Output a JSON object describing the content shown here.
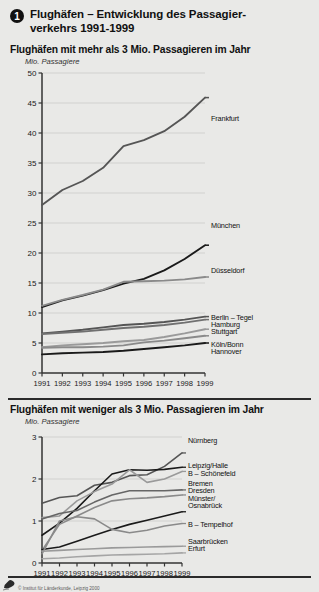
{
  "header": {
    "number": "1",
    "title_line1": "Flughäfen – Entwicklung des Passagier-",
    "title_line2": "verkehrs 1991-1999"
  },
  "panels": {
    "top": {
      "title": "Flughäfen mit mehr als 3 Mio. Passagieren im Jahr",
      "unit": "Mio. Passagiere"
    },
    "bottom": {
      "title": "Flughäfen mit weniger als 3 Mio. Passagieren im Jahr",
      "unit": "Mio. Passagiere"
    }
  },
  "footer": {
    "credit": "© Institut für Länderkunde, Leipzig 2000",
    "logo": "ifl-logo-icon"
  },
  "colors": {
    "background": "#e9e9e7",
    "dark_line": "#1a1a1a",
    "mid_line": "#666666",
    "light_line": "#9a9a9a",
    "grid": "#c9c9c5",
    "axis": "#333333"
  },
  "chart_data": [
    {
      "type": "line",
      "id": "top-chart",
      "title": "Flughäfen mit mehr als 3 Mio. Passagieren im Jahr",
      "xlabel": "",
      "ylabel": "Mio. Passagiere",
      "x": [
        "1991",
        "1992",
        "1993",
        "1994",
        "1995",
        "1996",
        "1997",
        "1998",
        "1999"
      ],
      "ylim": [
        0,
        50
      ],
      "yticks": [
        0,
        5,
        10,
        15,
        20,
        25,
        30,
        35,
        40,
        45,
        50
      ],
      "grid": true,
      "legend_position": "right-inline",
      "series": [
        {
          "name": "Frankfurt",
          "color": "#555555",
          "values": [
            28.0,
            30.5,
            32.0,
            34.2,
            37.8,
            38.8,
            40.3,
            42.7,
            45.9
          ]
        },
        {
          "name": "München",
          "color": "#1a1a1a",
          "values": [
            11.0,
            12.1,
            12.9,
            13.8,
            14.9,
            15.7,
            17.1,
            19.0,
            21.3
          ]
        },
        {
          "name": "Düsseldorf",
          "color": "#8a8a8a",
          "values": [
            11.2,
            12.2,
            13.0,
            13.9,
            15.2,
            15.3,
            15.4,
            15.6,
            16.0
          ]
        },
        {
          "name": "Berlin – Tegel",
          "color": "#555555",
          "values": [
            6.6,
            6.9,
            7.2,
            7.6,
            8.0,
            8.2,
            8.5,
            8.9,
            9.4
          ]
        },
        {
          "name": "Hamburg",
          "color": "#707070",
          "values": [
            6.5,
            6.7,
            6.9,
            7.2,
            7.5,
            7.7,
            8.0,
            8.4,
            8.9
          ]
        },
        {
          "name": "Stuttgart",
          "color": "#9a9a9a",
          "values": [
            4.3,
            4.6,
            4.8,
            5.0,
            5.3,
            5.5,
            6.0,
            6.6,
            7.3
          ]
        },
        {
          "name": "Köln/Bonn",
          "color": "#8a8a8a",
          "values": [
            4.2,
            4.3,
            4.3,
            4.4,
            4.6,
            5.1,
            5.4,
            5.8,
            6.2
          ]
        },
        {
          "name": "Hannover",
          "color": "#1a1a1a",
          "values": [
            3.1,
            3.3,
            3.4,
            3.5,
            3.7,
            4.0,
            4.3,
            4.6,
            5.0
          ]
        }
      ]
    },
    {
      "type": "line",
      "id": "bottom-chart",
      "title": "Flughäfen mit weniger als 3 Mio. Passagieren im Jahr",
      "xlabel": "",
      "ylabel": "Mio. Passagiere",
      "x": [
        "1991",
        "1992",
        "1993",
        "1994",
        "1995",
        "1996",
        "1997",
        "1998",
        "1999"
      ],
      "ylim": [
        0,
        3
      ],
      "yticks": [
        0,
        1,
        2,
        3
      ],
      "grid": true,
      "legend_position": "right-inline",
      "series": [
        {
          "name": "Nürnberg",
          "color": "#555555",
          "values": [
            1.42,
            1.56,
            1.6,
            1.85,
            1.92,
            2.08,
            2.1,
            2.3,
            2.62
          ]
        },
        {
          "name": "Leipzig/Halle",
          "color": "#1a1a1a",
          "values": [
            0.66,
            0.95,
            1.3,
            1.72,
            2.12,
            2.22,
            2.21,
            2.23,
            2.28
          ]
        },
        {
          "name": "B – Schönefeld",
          "color": "#9a9a9a",
          "values": [
            1.08,
            1.12,
            1.48,
            1.7,
            1.88,
            2.22,
            1.92,
            2.0,
            2.18
          ]
        },
        {
          "name": "Bremen",
          "color": "#666666",
          "values": [
            1.05,
            1.18,
            1.25,
            1.45,
            1.62,
            1.72,
            1.72,
            1.72,
            1.74
          ]
        },
        {
          "name": "Dresden",
          "color": "#8a8a8a",
          "values": [
            0.3,
            0.92,
            1.12,
            1.32,
            1.48,
            1.53,
            1.55,
            1.58,
            1.62
          ]
        },
        {
          "name": "Münster/Osnabrück",
          "color": "#1a1a1a",
          "values": [
            0.32,
            0.38,
            0.52,
            0.66,
            0.8,
            0.92,
            1.02,
            1.12,
            1.22
          ]
        },
        {
          "name": "B – Tempelhof",
          "color": "#8a8a8a",
          "values": [
            0.22,
            1.0,
            1.1,
            1.05,
            0.8,
            0.72,
            0.78,
            0.88,
            0.94
          ]
        },
        {
          "name": "Saarbrücken",
          "color": "#9a9a9a",
          "values": [
            0.28,
            0.3,
            0.32,
            0.34,
            0.36,
            0.37,
            0.38,
            0.39,
            0.4
          ]
        },
        {
          "name": "Erfurt",
          "color": "#a5a5a5",
          "values": [
            0.1,
            0.12,
            0.15,
            0.17,
            0.19,
            0.2,
            0.21,
            0.22,
            0.24
          ]
        }
      ]
    }
  ],
  "labels_top": [
    {
      "text": "Frankfurt",
      "top": 115
    },
    {
      "text": "München",
      "top": 222
    },
    {
      "text": "Düsseldorf",
      "top": 267
    },
    {
      "text": "Berlin – Tegel",
      "top": 314
    },
    {
      "text": "Hamburg",
      "top": 321
    },
    {
      "text": "Stuttgart",
      "top": 328
    },
    {
      "text": "Köln/Bonn",
      "top": 341
    },
    {
      "text": "Hannover",
      "top": 348
    }
  ],
  "labels_bottom": [
    {
      "text": "Nürnberg",
      "top": 437
    },
    {
      "text": "Leipzig/Halle",
      "top": 462
    },
    {
      "text": "B – Schönefeld",
      "top": 470
    },
    {
      "text": "Bremen",
      "top": 480
    },
    {
      "text": "Dresden",
      "top": 487
    },
    {
      "text": "Münster/",
      "top": 495
    },
    {
      "text": "Osnabrück",
      "top": 502
    },
    {
      "text": "B – Tempelhof",
      "top": 521
    },
    {
      "text": "Saarbrücken",
      "top": 538
    },
    {
      "text": "Erfurt",
      "top": 545
    }
  ]
}
